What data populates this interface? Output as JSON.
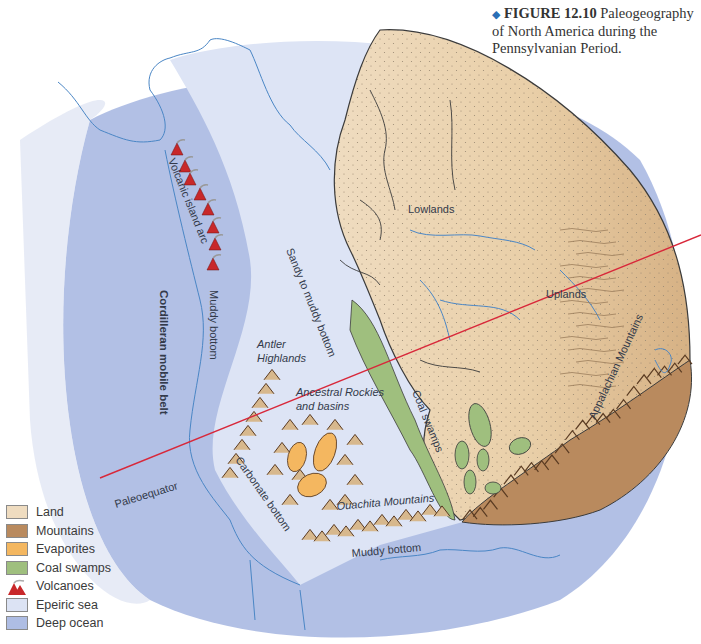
{
  "caption": {
    "marker": "◆",
    "figure_number": "FIGURE 12.10",
    "text": "Paleogeography of North America during the Pennsylvanian Period."
  },
  "map_labels": {
    "volcanic_arc": "Volcanic island arc",
    "cordilleran": "Cordilleran mobile belt",
    "muddy_bottom_west": "Muddy bottom",
    "sandy": "Sandy to muddy bottom",
    "antler": "Antler Highlands",
    "ancestral": "Ancestral Rockies and basins",
    "carbonate": "Carbonate bottom",
    "paleoequator": "Paleoequator",
    "ouachita": "Ouachita Mountains",
    "muddy_bottom_south": "Muddy bottom",
    "lowlands": "Lowlands",
    "uplands": "Uplands",
    "appalachian": "Appalachian Mountains",
    "coal_swamps": "Coal swamps"
  },
  "legend": [
    {
      "label": "Land",
      "icon": "land-swatch",
      "color": "#efdcc0"
    },
    {
      "label": "Mountains",
      "icon": "mountains-swatch",
      "color": "#b98a5e"
    },
    {
      "label": "Evaporites",
      "icon": "evaporites-swatch",
      "color": "#f4b760"
    },
    {
      "label": "Coal swamps",
      "icon": "coal-swamps-swatch",
      "color": "#9fbf7e"
    },
    {
      "label": "Volcanoes",
      "icon": "volcano-icon",
      "color": "#c8282a"
    },
    {
      "label": "Epeiric sea",
      "icon": "epeiric-sea-swatch",
      "color": "#dce3f4"
    },
    {
      "label": "Deep ocean",
      "icon": "deep-ocean-swatch",
      "color": "#aebde4"
    }
  ],
  "colors": {
    "deep_ocean": "#aebde4",
    "epeiric_sea": "#dde4f5",
    "land": "#efdcc0",
    "uplands": "#dcb98c",
    "mountains": "#b98a5e",
    "coal": "#9fbf7e",
    "evaporite": "#f4b760",
    "coastline": "#4a86c5",
    "equator": "#d8283a",
    "volcano": "#c8282a"
  }
}
